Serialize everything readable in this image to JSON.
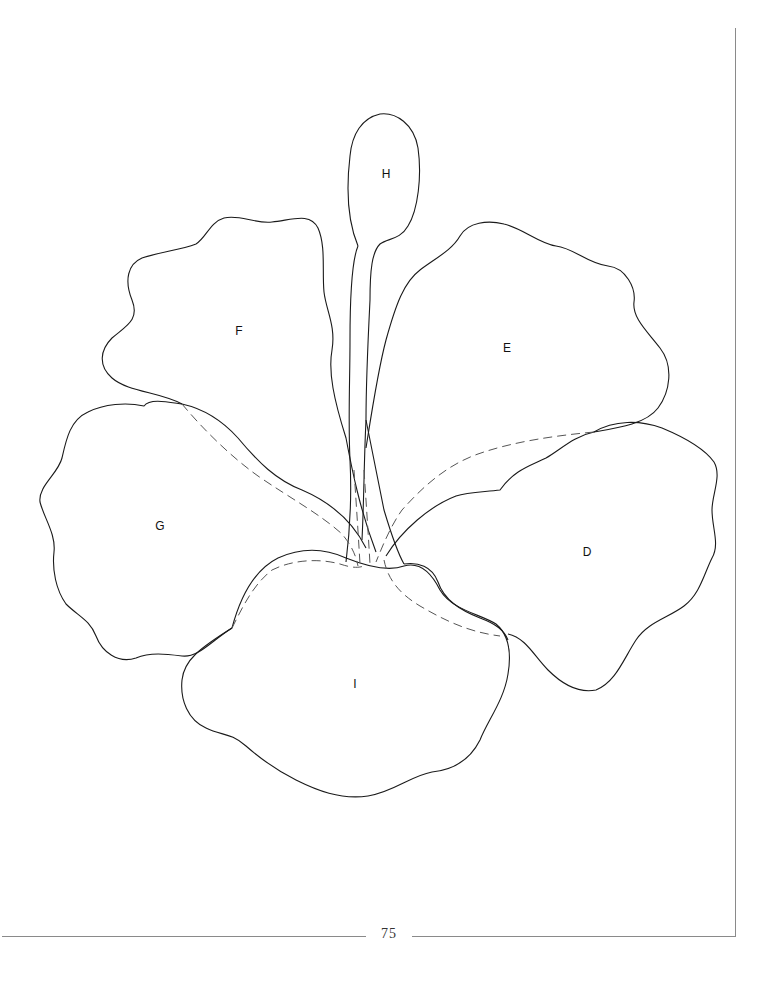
{
  "page": {
    "number": "75",
    "colors": {
      "line": "#1a1a1a",
      "dashed": "#555555",
      "border": "#8a8a8a",
      "background": "#ffffff"
    }
  },
  "pattern": {
    "subject": "hibiscus flower appliqué template",
    "pieces": [
      {
        "id": "H",
        "label": "H",
        "x": 386,
        "y": 174
      },
      {
        "id": "F",
        "label": "F",
        "x": 239,
        "y": 331
      },
      {
        "id": "E",
        "label": "E",
        "x": 507,
        "y": 348
      },
      {
        "id": "G",
        "label": "G",
        "x": 160,
        "y": 526
      },
      {
        "id": "D",
        "label": "D",
        "x": 587,
        "y": 552
      },
      {
        "id": "I",
        "label": "I",
        "x": 355,
        "y": 684
      }
    ]
  }
}
